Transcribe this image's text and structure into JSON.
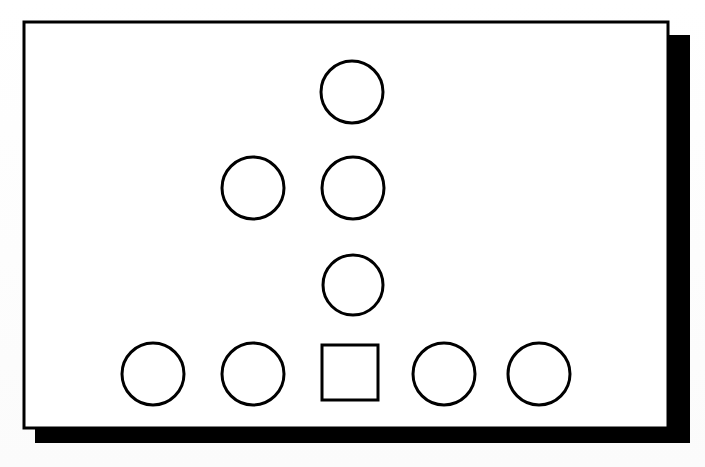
{
  "figure": {
    "kind": "shape-pattern-diagram",
    "background_color": "#ffffff",
    "paper_color": "#ffffff",
    "ink_color": "#000000",
    "shadow_color": "#000000",
    "frame": {
      "name": "outer-frame",
      "x": 24,
      "y": 22,
      "width": 644,
      "height": 406,
      "border_width": 3,
      "fill": "#ffffff",
      "stroke": "#000000"
    },
    "shadow": {
      "name": "drop-shadow",
      "x": 35,
      "y": 35,
      "width": 655,
      "height": 408,
      "fill": "#000000",
      "offset_x": 11,
      "offset_y": 13
    },
    "shapes": [
      {
        "id": "circle-r1-c3",
        "type": "circle",
        "row": 1,
        "column": 3,
        "cx": 352,
        "cy": 92,
        "r": 31,
        "stroke": "#000000",
        "stroke_width": 3,
        "fill": "none"
      },
      {
        "id": "circle-r2-c2",
        "type": "circle",
        "row": 2,
        "column": 2,
        "cx": 253,
        "cy": 188,
        "r": 31,
        "stroke": "#000000",
        "stroke_width": 3,
        "fill": "none"
      },
      {
        "id": "circle-r2-c3",
        "type": "circle",
        "row": 2,
        "column": 3,
        "cx": 353,
        "cy": 188,
        "r": 31,
        "stroke": "#000000",
        "stroke_width": 3,
        "fill": "none"
      },
      {
        "id": "circle-r3-c3",
        "type": "circle",
        "row": 3,
        "column": 3,
        "cx": 353,
        "cy": 285,
        "r": 30,
        "stroke": "#000000",
        "stroke_width": 3,
        "fill": "none"
      },
      {
        "id": "circle-r4-c1",
        "type": "circle",
        "row": 4,
        "column": 1,
        "cx": 153,
        "cy": 374,
        "r": 31,
        "stroke": "#000000",
        "stroke_width": 3,
        "fill": "none"
      },
      {
        "id": "circle-r4-c2",
        "type": "circle",
        "row": 4,
        "column": 2,
        "cx": 253,
        "cy": 374,
        "r": 31,
        "stroke": "#000000",
        "stroke_width": 3,
        "fill": "none"
      },
      {
        "id": "square-r4-c3",
        "type": "square",
        "row": 4,
        "column": 3,
        "x": 322,
        "y": 345,
        "width": 56,
        "height": 55,
        "stroke": "#000000",
        "stroke_width": 3,
        "fill": "none"
      },
      {
        "id": "circle-r4-c4",
        "type": "circle",
        "row": 4,
        "column": 4,
        "cx": 444,
        "cy": 374,
        "r": 31,
        "stroke": "#000000",
        "stroke_width": 3,
        "fill": "none"
      },
      {
        "id": "circle-r4-c5",
        "type": "circle",
        "row": 4,
        "column": 5,
        "cx": 539,
        "cy": 374,
        "r": 31,
        "stroke": "#000000",
        "stroke_width": 3,
        "fill": "none"
      }
    ],
    "counts": {
      "circles": 8,
      "squares": 1,
      "total_shapes": 9,
      "rows": 4
    }
  }
}
